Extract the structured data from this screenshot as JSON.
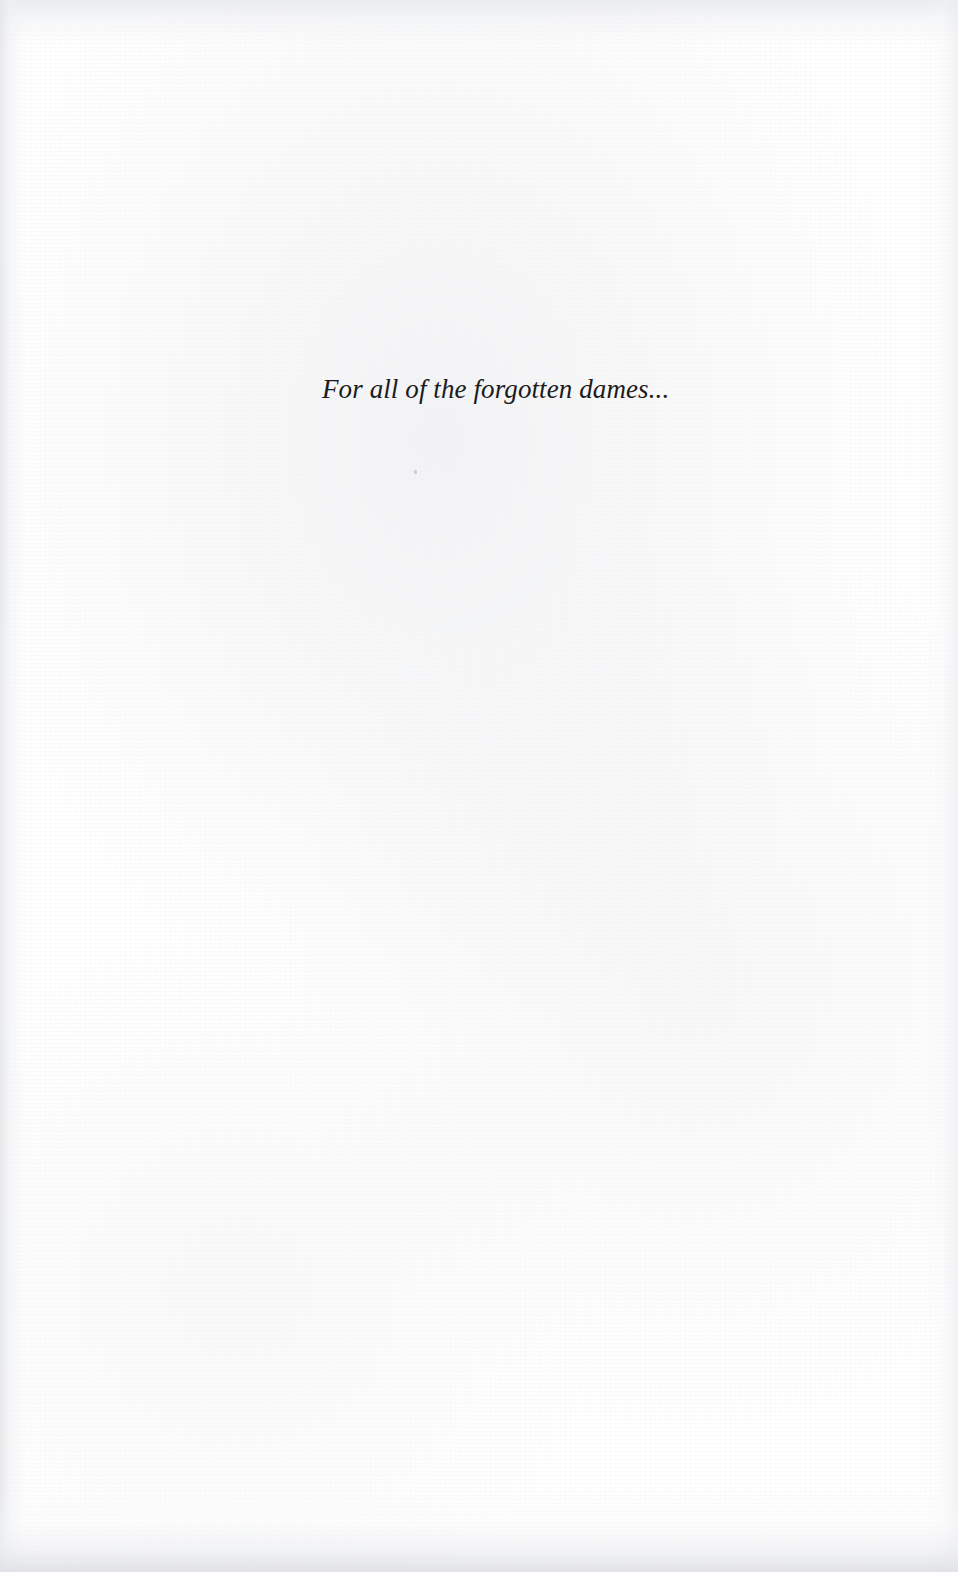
{
  "page": {
    "kind": "book-dedication-page",
    "width": 958,
    "height": 1572,
    "background_color": "#ffffff",
    "text_color": "#1b1b1d",
    "edge_shade_color": "#e0e1e4"
  },
  "dedication": {
    "text": "For all of the forgotten dames...",
    "style": "italic-serif",
    "alignment": "left-of-center"
  },
  "artifacts": {
    "speck_label": "scan-speck",
    "left_edge_label": "left-page-edge-shadow",
    "right_edge_label": "right-page-edge-shadow",
    "top_edge_label": "top-page-edge-shadow",
    "bottom_edge_label": "bottom-page-edge-shadow",
    "grain_label": "paper-grain-texture"
  }
}
